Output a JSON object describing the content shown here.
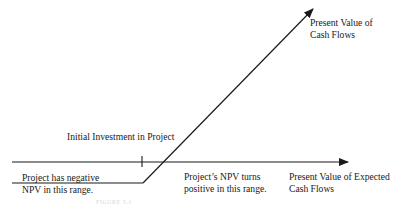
{
  "diagram": {
    "type": "npv-profile",
    "labels": {
      "y_axis_line1": "Present Value of",
      "y_axis_line2": "Cash Flows",
      "x_axis_line1": "Present Value of Expected",
      "x_axis_line2": "Cash Flows",
      "initial_investment": "Initial Investment in Project",
      "negative_line1": "Project has negative",
      "negative_line2": "NPV in this range.",
      "positive_line1": "Project’s NPV turns",
      "positive_line2": "positive in this range.",
      "caption": "FIGURE 5.1"
    },
    "colors": {
      "line": "#1a1a1a",
      "background": "#ffffff"
    }
  }
}
